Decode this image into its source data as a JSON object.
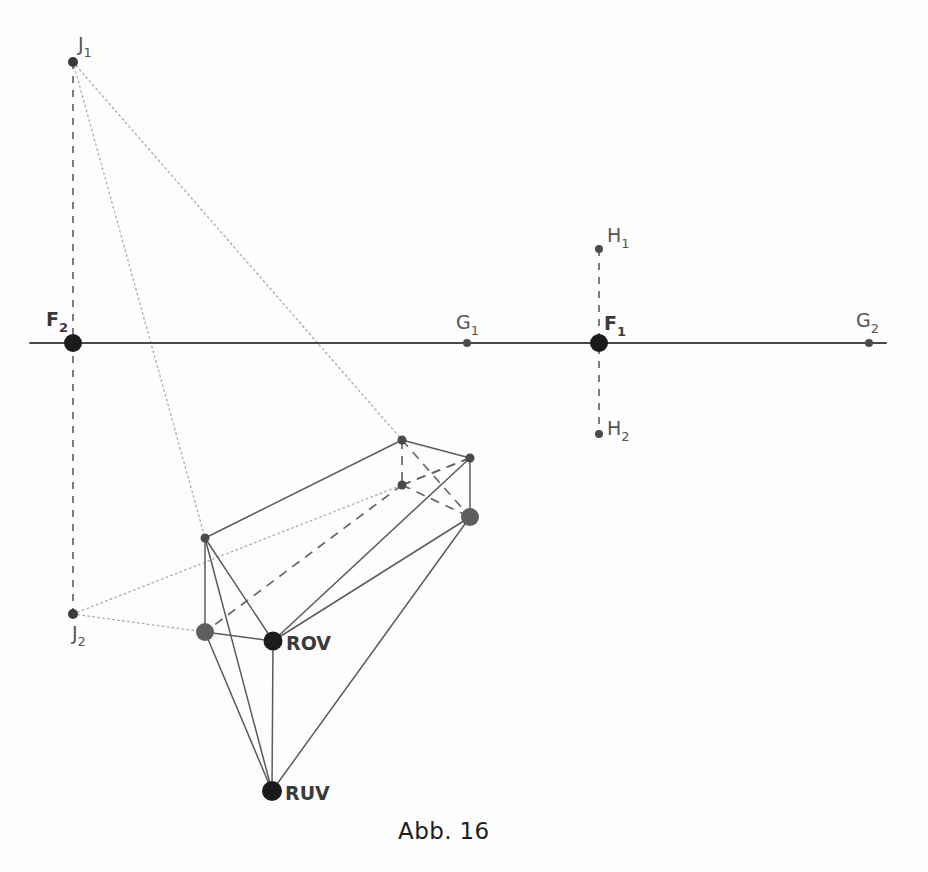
{
  "figure": {
    "caption": "Abb. 16",
    "caption_x": 398,
    "caption_y": 818,
    "background_color": "#fdfdfd",
    "line_color": "#5b5b5b",
    "dotted_color": "#a9a9a9",
    "node_color": "#1b1b1b"
  },
  "labels": {
    "F2": {
      "base": "F",
      "sub": "2",
      "x": 46,
      "y": 326,
      "style": "bold"
    },
    "F1": {
      "base": "F",
      "sub": "1",
      "x": 604,
      "y": 330,
      "style": "bold"
    },
    "G1": {
      "base": "G",
      "sub": "1",
      "x": 456,
      "y": 329,
      "style": "plain"
    },
    "G2": {
      "base": "G",
      "sub": "2",
      "x": 856,
      "y": 327,
      "style": "plain"
    },
    "H1": {
      "base": "H",
      "sub": "1",
      "x": 607,
      "y": 242,
      "style": "plain"
    },
    "H2": {
      "base": "H",
      "sub": "2",
      "x": 607,
      "y": 435,
      "style": "plain"
    },
    "J1": {
      "base": "J",
      "sub": "1",
      "x": 78,
      "y": 51,
      "style": "plain"
    },
    "J2": {
      "base": "J",
      "sub": "2",
      "x": 72,
      "y": 640,
      "style": "plain"
    },
    "ROV": {
      "base": "ROV",
      "sub": "",
      "x": 286,
      "y": 650,
      "style": "bold"
    },
    "RUV": {
      "base": "RUV",
      "sub": "",
      "x": 285,
      "y": 800,
      "style": "bold"
    }
  },
  "chart_data": {
    "type": "diagram",
    "title": "Abb. 16",
    "canvas": {
      "width": 928,
      "height": 872
    },
    "horizon_line": {
      "x1": 30,
      "y1": 343,
      "x2": 886,
      "y2": 343
    },
    "points": [
      {
        "name": "F2",
        "x": 73,
        "y": 343,
        "size": 9,
        "color": "#1b1b1b",
        "kind": "vanishing-point"
      },
      {
        "name": "F1",
        "x": 599,
        "y": 343,
        "size": 9,
        "color": "#1b1b1b",
        "kind": "vanishing-point"
      },
      {
        "name": "G1",
        "x": 467,
        "y": 343,
        "size": 4,
        "color": "#4a4a4a",
        "kind": "measuring-point"
      },
      {
        "name": "G2",
        "x": 869,
        "y": 343,
        "size": 4,
        "color": "#4a4a4a",
        "kind": "measuring-point"
      },
      {
        "name": "H1",
        "x": 599,
        "y": 249,
        "size": 4,
        "color": "#4a4a4a",
        "kind": "auxiliary-point"
      },
      {
        "name": "H2",
        "x": 599,
        "y": 434,
        "size": 4,
        "color": "#4a4a4a",
        "kind": "auxiliary-point"
      },
      {
        "name": "J1",
        "x": 73,
        "y": 62,
        "size": 5,
        "color": "#3a3a3a",
        "kind": "auxiliary-point"
      },
      {
        "name": "J2",
        "x": 73,
        "y": 614,
        "size": 5,
        "color": "#3a3a3a",
        "kind": "auxiliary-point"
      },
      {
        "name": "A",
        "x": 205,
        "y": 538,
        "size": 4.5,
        "color": "#4a4a4a",
        "kind": "box-vertex"
      },
      {
        "name": "B",
        "x": 402,
        "y": 440,
        "size": 4.5,
        "color": "#4a4a4a",
        "kind": "box-vertex"
      },
      {
        "name": "C",
        "x": 470,
        "y": 458,
        "size": 4.5,
        "color": "#4a4a4a",
        "kind": "box-vertex"
      },
      {
        "name": "D",
        "x": 402,
        "y": 485,
        "size": 4.5,
        "color": "#4a4a4a",
        "kind": "hidden-vertex"
      },
      {
        "name": "E",
        "x": 470,
        "y": 517,
        "size": 9,
        "color": "#5e5e5e",
        "kind": "box-vertex"
      },
      {
        "name": "ROV_left",
        "x": 205,
        "y": 632,
        "size": 9,
        "color": "#5e5e5e",
        "kind": "box-vertex"
      },
      {
        "name": "ROV",
        "x": 273,
        "y": 641,
        "size": 9.5,
        "color": "#1b1b1b",
        "kind": "named-vertex"
      },
      {
        "name": "RUV",
        "x": 272,
        "y": 791,
        "size": 10,
        "color": "#1b1b1b",
        "kind": "named-vertex"
      }
    ],
    "solid_edges": [
      {
        "from": "A",
        "to": "B"
      },
      {
        "from": "B",
        "to": "C"
      },
      {
        "from": "A",
        "to": "ROV_left"
      },
      {
        "from": "A",
        "to": "ROV"
      },
      {
        "from": "A",
        "to": "RUV"
      },
      {
        "from": "ROV",
        "to": "C"
      },
      {
        "from": "C",
        "to": "E"
      },
      {
        "from": "ROV_left",
        "to": "ROV"
      },
      {
        "from": "ROV",
        "to": "RUV"
      },
      {
        "from": "ROV_left",
        "to": "RUV"
      },
      {
        "from": "RUV",
        "to": "E"
      },
      {
        "from": "ROV",
        "to": "E"
      }
    ],
    "dashed_edges": [
      {
        "from": "B",
        "to": "D"
      },
      {
        "from": "D",
        "to": "C"
      },
      {
        "from": "D",
        "to": "E"
      },
      {
        "from": "B",
        "to": "E"
      },
      {
        "from": "D",
        "to": "ROV_left"
      },
      {
        "from": "C",
        "to": "D"
      }
    ],
    "vertical_dashed_lines": [
      {
        "x": 73,
        "y1": 62,
        "y2": 614,
        "label": "F2 vertical"
      },
      {
        "x": 599,
        "y1": 249,
        "y2": 434,
        "label": "F1 vertical"
      }
    ],
    "dotted_rays": [
      {
        "from": "J1",
        "to": "B"
      },
      {
        "from": "J1",
        "to": "A"
      },
      {
        "from": "J2",
        "to": "D"
      },
      {
        "from": "J2",
        "to": "ROV_left"
      }
    ]
  }
}
